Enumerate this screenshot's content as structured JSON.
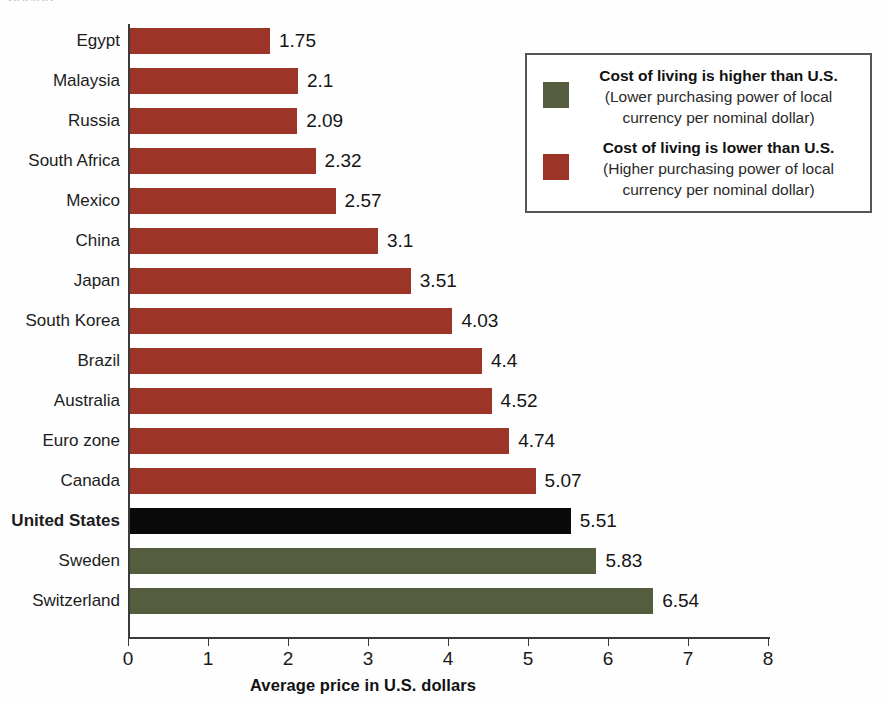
{
  "top_fragment": "pricing",
  "chart_data": {
    "type": "bar",
    "orientation": "horizontal",
    "title": "",
    "xlabel": "Average price in U.S. dollars",
    "ylabel": "",
    "xlim": [
      0,
      8
    ],
    "xticks": [
      0,
      1,
      2,
      3,
      4,
      5,
      6,
      7,
      8
    ],
    "xtick_labels": [
      "0",
      "1",
      "2",
      "3",
      "4",
      "5",
      "6",
      "7",
      "8"
    ],
    "grid": false,
    "legend_position": "upper-right",
    "categories": [
      "Egypt",
      "Malaysia",
      "Russia",
      "South Africa",
      "Mexico",
      "China",
      "Japan",
      "South Korea",
      "Brazil",
      "Australia",
      "Euro zone",
      "Canada",
      "United States",
      "Sweden",
      "Switzerland"
    ],
    "values": [
      1.75,
      2.1,
      2.09,
      2.32,
      2.57,
      3.1,
      3.51,
      4.03,
      4.4,
      4.52,
      4.74,
      5.07,
      5.51,
      5.83,
      6.54
    ],
    "value_labels": [
      "1.75",
      "2.1",
      "2.09",
      "2.32",
      "2.57",
      "3.1",
      "3.51",
      "4.03",
      "4.4",
      "4.52",
      "4.74",
      "5.07",
      "5.51",
      "5.83",
      "6.54"
    ],
    "bar_colors": [
      "#9c3527",
      "#9c3527",
      "#9c3527",
      "#9c3527",
      "#9c3527",
      "#9c3527",
      "#9c3527",
      "#9c3527",
      "#9c3527",
      "#9c3527",
      "#9c3527",
      "#9c3527",
      "#0a0a0a",
      "#545e3f",
      "#545e3f"
    ],
    "bar_classes": [
      "red",
      "red",
      "red",
      "red",
      "red",
      "red",
      "red",
      "red",
      "red",
      "red",
      "red",
      "red",
      "black",
      "green",
      "green"
    ],
    "bold_categories": [
      "United States"
    ],
    "colors": {
      "lower_cost_of_living": "#9c3527",
      "higher_cost_of_living": "#545e3f",
      "reference": "#0a0a0a",
      "axis": "#3b3b3b",
      "text": "#1a1a1a"
    },
    "legend": [
      {
        "swatch_color": "#545e3f",
        "swatch_class": "green",
        "title": "Cost of living is higher than U.S.",
        "sub_line1": "(Lower purchasing power of local",
        "sub_line2": "currency per nominal dollar)"
      },
      {
        "swatch_color": "#9c3527",
        "swatch_class": "red",
        "title": "Cost of living is lower than U.S.",
        "sub_line1": "(Higher purchasing power of local",
        "sub_line2": "currency per nominal dollar)"
      }
    ]
  }
}
